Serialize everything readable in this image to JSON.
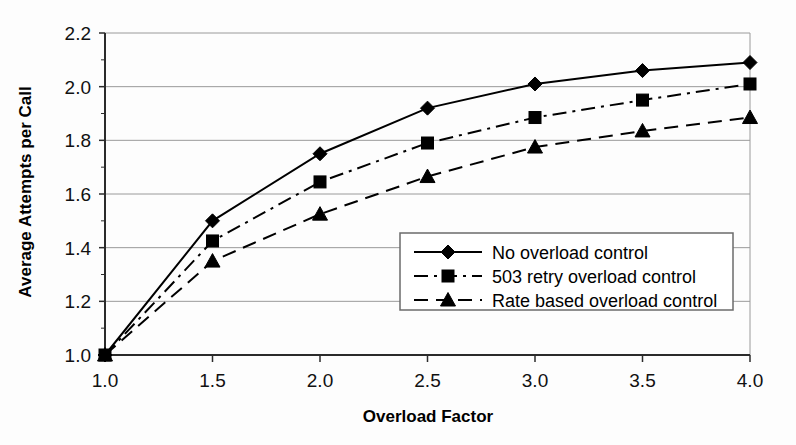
{
  "chart_data": {
    "type": "line",
    "title": "",
    "xlabel": "Overload Factor",
    "ylabel": "Average Attempts per Call",
    "x": [
      1.0,
      1.5,
      2.0,
      2.5,
      3.0,
      3.5,
      4.0
    ],
    "xticklabels": [
      "1.0",
      "1.5",
      "2.0",
      "2.5",
      "3.0",
      "3.5",
      "4.0"
    ],
    "yticklabels": [
      "1.0",
      "1.2",
      "1.4",
      "1.6",
      "1.8",
      "2.0",
      "2.2"
    ],
    "yticks": [
      1.0,
      1.2,
      1.4,
      1.6,
      1.8,
      2.0,
      2.2
    ],
    "xlim": [
      1.0,
      4.0
    ],
    "ylim": [
      1.0,
      2.2
    ],
    "grid": "horizontal",
    "legend_position": "lower-right-inside",
    "series": [
      {
        "name": "No overload control",
        "marker": "diamond",
        "dash": "solid",
        "values": [
          1.0,
          1.5,
          1.75,
          1.92,
          2.01,
          2.06,
          2.09
        ]
      },
      {
        "name": "503 retry overload control",
        "marker": "square",
        "dash": "dashdot",
        "values": [
          1.0,
          1.425,
          1.645,
          1.79,
          1.885,
          1.95,
          2.01
        ]
      },
      {
        "name": "Rate based overload control",
        "marker": "triangle",
        "dash": "dashed",
        "values": [
          1.0,
          1.35,
          1.525,
          1.665,
          1.775,
          1.835,
          1.885
        ]
      }
    ]
  }
}
